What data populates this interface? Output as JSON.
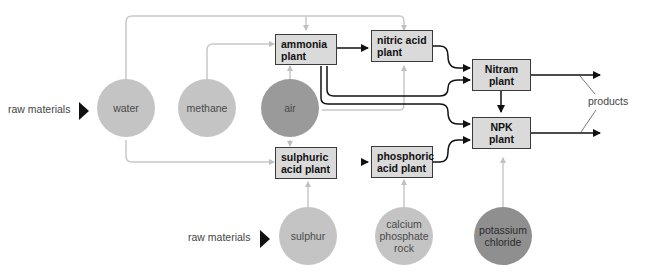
{
  "diagram": {
    "raw_materials_label_1": "raw materials",
    "raw_materials_label_2": "raw materials",
    "products_label": "products",
    "inputs": {
      "water": "water",
      "methane": "methane",
      "air": "air",
      "sulphur": "sulphur",
      "calcium_phosphate_rock": "calcium phosphate rock",
      "potassium_chloride": "potassium chloride"
    },
    "plants": {
      "ammonia": "ammonia plant",
      "nitric_acid": "nitric acid plant",
      "nitram": "Nitram plant",
      "npk": "NPK plant",
      "sulphuric_acid": "sulphuric acid plant",
      "phosphoric_acid": "phosphoric acid plant"
    },
    "colors": {
      "light_circle": "#c4c4c4",
      "dark_circle": "#8f8f8f",
      "box_fill": "#dadada",
      "raw_line": "#c8c8c8",
      "product_line": "#111111"
    },
    "edges": [
      {
        "from": "water",
        "to": "ammonia plant"
      },
      {
        "from": "water",
        "to": "nitric acid plant"
      },
      {
        "from": "water",
        "to": "sulphuric acid plant"
      },
      {
        "from": "methane",
        "to": "ammonia plant"
      },
      {
        "from": "air",
        "to": "ammonia plant"
      },
      {
        "from": "air",
        "to": "nitric acid plant"
      },
      {
        "from": "air",
        "to": "sulphuric acid plant"
      },
      {
        "from": "ammonia plant",
        "to": "nitric acid plant"
      },
      {
        "from": "ammonia plant",
        "to": "Nitram plant"
      },
      {
        "from": "ammonia plant",
        "to": "NPK plant"
      },
      {
        "from": "nitric acid plant",
        "to": "Nitram plant"
      },
      {
        "from": "nitric acid plant",
        "to": "NPK plant"
      },
      {
        "from": "sulphur",
        "to": "sulphuric acid plant"
      },
      {
        "from": "sulphuric acid plant",
        "to": "phosphoric acid plant"
      },
      {
        "from": "calcium phosphate rock",
        "to": "phosphoric acid plant"
      },
      {
        "from": "phosphoric acid plant",
        "to": "NPK plant"
      },
      {
        "from": "Nitram plant",
        "to": "NPK plant"
      },
      {
        "from": "potassium chloride",
        "to": "NPK plant"
      },
      {
        "from": "Nitram plant",
        "to": "products"
      },
      {
        "from": "NPK plant",
        "to": "products"
      }
    ]
  }
}
